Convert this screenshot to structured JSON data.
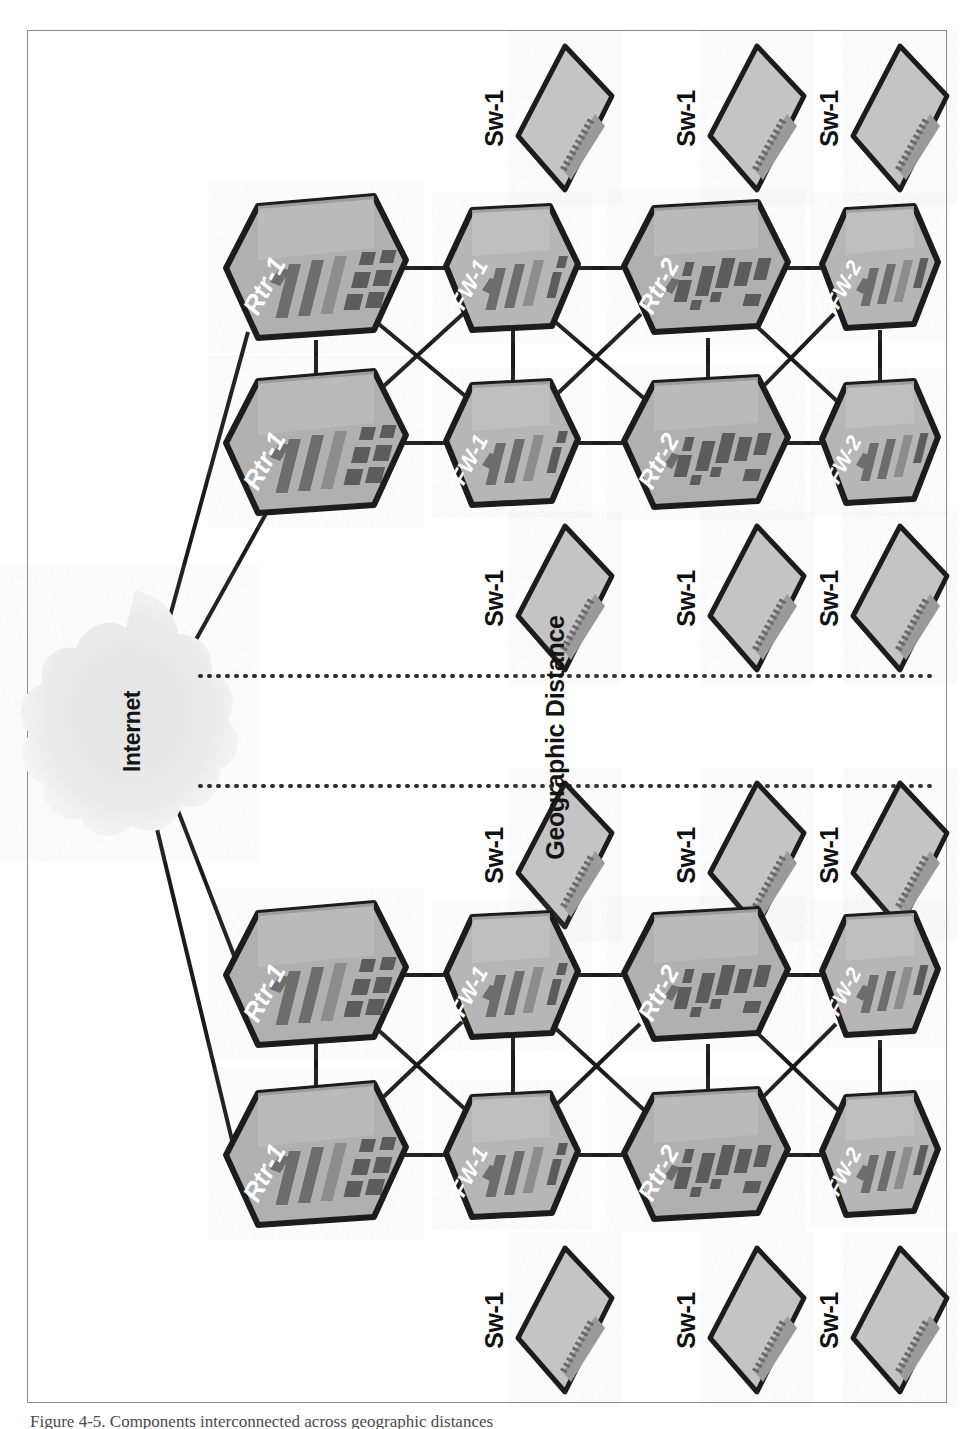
{
  "figure": {
    "caption": "Figure 4-5. Components interconnected across geographic distances",
    "geographic_divider_label": "Geographic Distance",
    "orientation": "rotated-90-ccw"
  },
  "cloud": {
    "label": "Internet",
    "fill": "#e8e8e8"
  },
  "colors": {
    "device_fill_light": "#c9c9c9",
    "device_fill_dark": "#a8a8a8",
    "device_stroke": "#1a1a1a",
    "link_stroke": "#1a1a1a",
    "label_white": "#ffffff",
    "label_black": "#111111",
    "frame_border": "#8a8a8a",
    "divider_dots": "#2b2b2b"
  },
  "sites": [
    {
      "id": "site-top",
      "name": "Site A",
      "switches_outer": [
        {
          "label": "Sw-1"
        },
        {
          "label": "Sw-1"
        },
        {
          "label": "Sw-1"
        }
      ],
      "devices_row_a": [
        {
          "label": "Rtr-1",
          "type": "router"
        },
        {
          "label": "FW-1",
          "type": "firewall"
        },
        {
          "label": "Rtr-2",
          "type": "router"
        },
        {
          "label": "FW-2",
          "type": "firewall"
        }
      ],
      "devices_row_b": [
        {
          "label": "Rtr-1",
          "type": "router"
        },
        {
          "label": "FW-1",
          "type": "firewall"
        },
        {
          "label": "Rtr-2",
          "type": "router"
        },
        {
          "label": "FW-2",
          "type": "firewall"
        }
      ],
      "switches_inner": [
        {
          "label": "Sw-1"
        },
        {
          "label": "Sw-1"
        },
        {
          "label": "Sw-1"
        }
      ]
    },
    {
      "id": "site-bottom",
      "name": "Site B",
      "switches_outer": [
        {
          "label": "Sw-1"
        },
        {
          "label": "Sw-1"
        },
        {
          "label": "Sw-1"
        }
      ],
      "devices_row_a": [
        {
          "label": "Rtr-1",
          "type": "router"
        },
        {
          "label": "FW-1",
          "type": "firewall"
        },
        {
          "label": "Rtr-2",
          "type": "router"
        },
        {
          "label": "FW-2",
          "type": "firewall"
        }
      ],
      "devices_row_b": [
        {
          "label": "Rtr-1",
          "type": "router"
        },
        {
          "label": "FW-1",
          "type": "firewall"
        },
        {
          "label": "Rtr-2",
          "type": "router"
        },
        {
          "label": "FW-2",
          "type": "firewall"
        }
      ],
      "switches_inner": [
        {
          "label": "Sw-1"
        },
        {
          "label": "Sw-1"
        },
        {
          "label": "Sw-1"
        }
      ]
    }
  ]
}
